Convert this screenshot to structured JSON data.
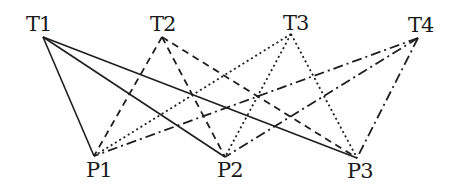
{
  "diagram": {
    "type": "bipartite-graph",
    "top_nodes": [
      {
        "id": "T1",
        "label": "T1",
        "x": 43,
        "y": 37,
        "label_x": 26,
        "label_y": 14
      },
      {
        "id": "T2",
        "label": "T2",
        "x": 162,
        "y": 37,
        "label_x": 150,
        "label_y": 14
      },
      {
        "id": "T3",
        "label": "T3",
        "x": 291,
        "y": 34,
        "label_x": 283,
        "label_y": 13
      },
      {
        "id": "T4",
        "label": "T4",
        "x": 418,
        "y": 38,
        "label_x": 408,
        "label_y": 15
      }
    ],
    "bottom_nodes": [
      {
        "id": "P1",
        "label": "P1",
        "x": 94,
        "y": 156,
        "label_x": 86,
        "label_y": 160
      },
      {
        "id": "P2",
        "label": "P2",
        "x": 225,
        "y": 157,
        "label_x": 217,
        "label_y": 160
      },
      {
        "id": "P3",
        "label": "P3",
        "x": 357,
        "y": 158,
        "label_x": 347,
        "label_y": 161
      }
    ],
    "line_styles": {
      "T1": {
        "style": "solid",
        "dasharray": ""
      },
      "T2": {
        "style": "dashed",
        "dasharray": "7 5"
      },
      "T3": {
        "style": "dotted",
        "dasharray": "2 3"
      },
      "T4": {
        "style": "dash-dot",
        "dasharray": "10 4 2 4"
      }
    },
    "edges": [
      {
        "from": "T1",
        "to": "P1"
      },
      {
        "from": "T1",
        "to": "P2"
      },
      {
        "from": "T1",
        "to": "P3"
      },
      {
        "from": "T2",
        "to": "P1"
      },
      {
        "from": "T2",
        "to": "P2"
      },
      {
        "from": "T2",
        "to": "P3"
      },
      {
        "from": "T3",
        "to": "P1"
      },
      {
        "from": "T3",
        "to": "P2"
      },
      {
        "from": "T3",
        "to": "P3"
      },
      {
        "from": "T4",
        "to": "P1"
      },
      {
        "from": "T4",
        "to": "P2"
      },
      {
        "from": "T4",
        "to": "P3"
      }
    ]
  }
}
